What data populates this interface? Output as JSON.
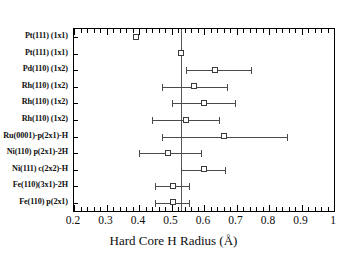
{
  "chart_data": {
    "type": "scatter",
    "title": "",
    "xlabel": "Hard Core H Radius (Å)",
    "ylabel": "",
    "xlim": [
      0.2,
      1.0
    ],
    "xticks": [
      0.2,
      0.3,
      0.4,
      0.5,
      0.6,
      0.7,
      0.8,
      0.9,
      1.0
    ],
    "xticklabels": [
      "0.2",
      "0.3",
      "0.4",
      "0.5",
      "0.6",
      "0.7",
      "0.8",
      "0.9",
      "1"
    ],
    "minor_ticks_per_interval": 5,
    "grid": false,
    "legend": null,
    "reference_line_x": 0.53,
    "marker_style": "open-square",
    "categories": [
      "Pt(111) (1x1)",
      "Pt(111) (1x1)",
      "Pd(110) (1x2)",
      "Rh(110) (1x2)",
      "Rh(110) (1x2)",
      "Rh(110) (1x2)",
      "Ru(0001)-p(2x1)-H",
      "Ni(110) p(2x1)-2H",
      "Ni(111) c(2x2)-H",
      "Fe(110)(3x1)-2H",
      "Fe(110) p(2x1)"
    ],
    "values": [
      0.39,
      0.53,
      0.635,
      0.57,
      0.6,
      0.545,
      0.66,
      0.49,
      0.6,
      0.505,
      0.505
    ],
    "err_low": [
      null,
      null,
      0.545,
      0.47,
      0.5,
      0.44,
      0.47,
      0.4,
      0.53,
      0.45,
      0.45
    ],
    "err_high": [
      null,
      null,
      0.745,
      0.67,
      0.695,
      0.645,
      0.855,
      0.59,
      0.665,
      0.555,
      0.555
    ]
  },
  "axis": {
    "x_title": "Hard Core H Radius (Å)"
  }
}
